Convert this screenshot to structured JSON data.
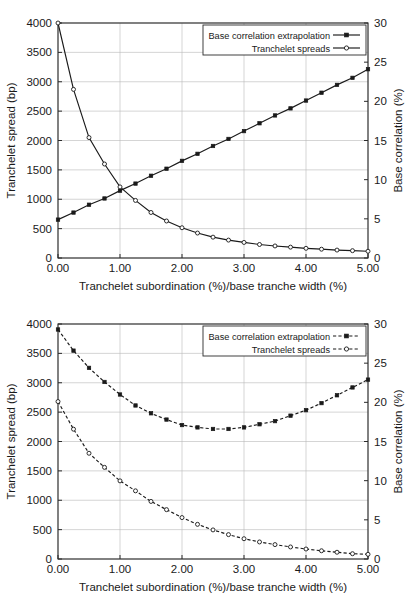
{
  "chart_data": [
    {
      "type": "line",
      "title": "",
      "xlabel": "Tranchelet subordination (%)/base tranche width (%)",
      "ylabel": "Tranchelet spread (bp)",
      "y2label": "Base correlation (%)",
      "xlim": [
        0,
        5
      ],
      "ylim": [
        0,
        4000
      ],
      "y2lim": [
        0,
        30
      ],
      "xticks": [
        "0.00",
        "1.00",
        "2.00",
        "3.00",
        "4.00",
        "5.00"
      ],
      "yticks": [
        "0",
        "500",
        "1000",
        "1500",
        "2000",
        "2500",
        "3000",
        "3500",
        "4000"
      ],
      "y2ticks": [
        "0",
        "5",
        "10",
        "15",
        "20",
        "25",
        "30"
      ],
      "grid": true,
      "legend_position": "top-right",
      "x": [
        0,
        0.25,
        0.5,
        0.75,
        1,
        1.25,
        1.5,
        1.75,
        2,
        2.25,
        2.5,
        2.75,
        3,
        3.25,
        3.5,
        3.75,
        4,
        4.25,
        4.5,
        4.75,
        5
      ],
      "series": [
        {
          "name": "Base correlation extrapolation",
          "axis": "right",
          "units": "%",
          "marker": "filled-square",
          "linestyle": "solid",
          "values": [
            4.9,
            5.8,
            6.8,
            7.6,
            8.6,
            9.5,
            10.5,
            11.4,
            12.4,
            13.3,
            14.3,
            15.2,
            16.2,
            17.2,
            18.2,
            19.1,
            20.1,
            21.1,
            22.1,
            23.0,
            24.1
          ]
        },
        {
          "name": "Tranchelet spreads",
          "axis": "left",
          "units": "bp",
          "marker": "open-circle",
          "linestyle": "solid",
          "values": [
            4000,
            2870,
            2050,
            1600,
            1210,
            980,
            775,
            630,
            515,
            425,
            355,
            305,
            265,
            230,
            205,
            185,
            165,
            150,
            135,
            125,
            115
          ]
        }
      ]
    },
    {
      "type": "line",
      "title": "",
      "xlabel": "Tranchelet subordination (%)/base tranche width (%)",
      "ylabel": "Tranchelet spread (bp)",
      "y2label": "Base correlation (%)",
      "xlim": [
        0,
        5
      ],
      "ylim": [
        0,
        4000
      ],
      "y2lim": [
        0,
        30
      ],
      "xticks": [
        "0.00",
        "1.00",
        "2.00",
        "3.00",
        "4.00",
        "5.00"
      ],
      "yticks": [
        "0",
        "500",
        "1000",
        "1500",
        "2000",
        "2500",
        "3000",
        "3500",
        "4000"
      ],
      "y2ticks": [
        "0",
        "5",
        "10",
        "15",
        "20",
        "25",
        "30"
      ],
      "grid": true,
      "legend_position": "top-right",
      "x": [
        0,
        0.25,
        0.5,
        0.75,
        1,
        1.25,
        1.5,
        1.75,
        2,
        2.25,
        2.5,
        2.75,
        3,
        3.25,
        3.5,
        3.75,
        4,
        4.25,
        4.5,
        4.75,
        5
      ],
      "series": [
        {
          "name": "Base correlation extrapolation",
          "axis": "right",
          "units": "%",
          "marker": "filled-square",
          "linestyle": "dashed",
          "values": [
            29.3,
            26.6,
            24.4,
            22.6,
            21.0,
            19.6,
            18.6,
            17.8,
            17.1,
            16.8,
            16.6,
            16.6,
            16.8,
            17.2,
            17.6,
            18.3,
            19.0,
            19.9,
            20.9,
            21.9,
            22.9
          ]
        },
        {
          "name": "Tranchelet spreads",
          "axis": "left",
          "units": "bp",
          "marker": "open-circle",
          "linestyle": "dashed",
          "values": [
            2680,
            2210,
            1800,
            1560,
            1330,
            1160,
            980,
            840,
            705,
            590,
            495,
            415,
            345,
            290,
            245,
            205,
            170,
            140,
            115,
            90,
            80
          ]
        }
      ]
    }
  ]
}
